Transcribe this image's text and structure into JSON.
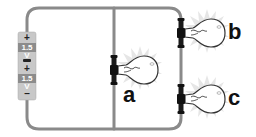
{
  "diagram": {
    "wire_color": "#8a8a8a",
    "battery": {
      "cells": [
        {
          "positive_sign": "+",
          "voltage_label": "1.5 V"
        },
        {
          "positive_sign": "+",
          "voltage_label": "1.5 V"
        }
      ],
      "negative_sign": "–",
      "body_color": "#c8c8c8",
      "label_band_color": "#8c8c8c"
    },
    "bulbs": [
      {
        "id": "a",
        "label": "a",
        "branch": "middle"
      },
      {
        "id": "b",
        "label": "b",
        "branch": "right-top"
      },
      {
        "id": "c",
        "label": "c",
        "branch": "right-bottom"
      }
    ]
  }
}
